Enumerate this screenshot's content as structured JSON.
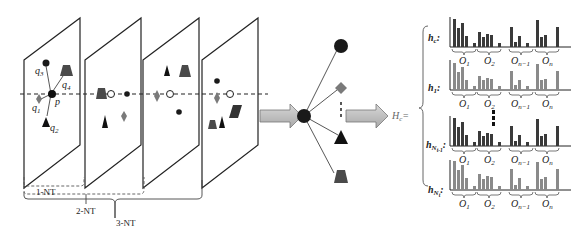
{
  "panel_left": {
    "planes_count": 4,
    "plane1_labels": {
      "p": "p",
      "q1": "q",
      "q1_sub": "1",
      "q2": "q",
      "q2_sub": "2",
      "q3": "q",
      "q3_sub": "3",
      "q4": "q",
      "q4_sub": "4"
    },
    "braces": {
      "nt1": "1-NT",
      "nt2": "2-NT",
      "nt3": "3-NT"
    }
  },
  "panel_middle": {
    "hub": "center-node",
    "spokes": [
      "circle",
      "diamond",
      "triangle",
      "trapezoid"
    ]
  },
  "panel_right": {
    "equation_label": "H",
    "equation_sub": "c",
    "equation_suffix": "=",
    "rows": [
      {
        "label": "h",
        "sub": "c",
        "suffix": ":",
        "groups": [
          "O1",
          "O2",
          "On-1",
          "On"
        ]
      },
      {
        "label": "h",
        "sub": "1",
        "suffix": ":",
        "groups": [
          "O1",
          "O2",
          "On-1",
          "On"
        ]
      },
      {
        "label": "h",
        "sub": "Nt-1",
        "suffix": ":",
        "groups": [
          "O1",
          "O2",
          "On-1",
          "On"
        ]
      },
      {
        "label": "h",
        "sub": "Nt",
        "suffix": ":",
        "groups": [
          "O1",
          "O2",
          "On-1",
          "On"
        ]
      }
    ],
    "group_labels": {
      "o1": "O",
      "o1_sub": "1",
      "o2": "O",
      "o2_sub": "2",
      "on1": "O",
      "on1_sub": "n−1",
      "on": "O",
      "on_sub": "n"
    },
    "row_sub_labels": {
      "c": "c",
      "one": "1",
      "nt1_main": "N",
      "nt1_sub": "t-1",
      "nt_main": "N",
      "nt_sub": "t"
    },
    "colors": {
      "row_c": "#3a3a3a",
      "row_1": "#8a8a8a",
      "row_nt1": "#3a3a3a",
      "row_nt": "#8a8a8a"
    }
  }
}
